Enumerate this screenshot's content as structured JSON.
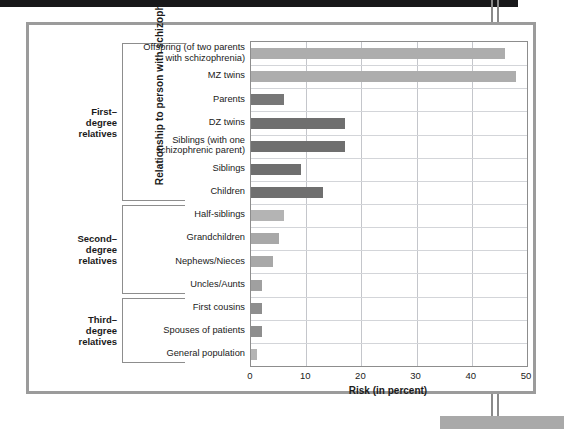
{
  "chart_data": {
    "type": "bar",
    "orientation": "horizontal",
    "title": "",
    "xlabel": "Risk (in percent)",
    "ylabel": "Relationship to person with schizophrenia",
    "xlim": [
      0,
      50
    ],
    "xticks": [
      0,
      10,
      20,
      30,
      40,
      50
    ],
    "grid": true,
    "legend": "none",
    "categories": [
      "Offspring (of two parents\nwith schizophrenia)",
      "MZ twins",
      "Parents",
      "DZ twins",
      "Siblings (with one\nschizophrenic parent)",
      "Siblings",
      "Children",
      "Half-siblings",
      "Grandchildren",
      "Nephews/Nieces",
      "Uncles/Aunts",
      "First cousins",
      "Spouses  of patients",
      "General population"
    ],
    "values": [
      46,
      48,
      6,
      17,
      17,
      9,
      13,
      6,
      5,
      4,
      2,
      2,
      2,
      1
    ],
    "bars": [
      {
        "label_line1": "Offspring (of two parents",
        "label_line2": "with schizophrenia)",
        "value": 46,
        "color": "#adadad"
      },
      {
        "label_line1": "MZ twins",
        "label_line2": "",
        "value": 48,
        "color": "#adadad"
      },
      {
        "label_line1": "Parents",
        "label_line2": "",
        "value": 6,
        "color": "#777777"
      },
      {
        "label_line1": "DZ twins",
        "label_line2": "",
        "value": 17,
        "color": "#6f6f6f"
      },
      {
        "label_line1": "Siblings (with one",
        "label_line2": "schizophrenic parent)",
        "value": 17,
        "color": "#6f6f6f"
      },
      {
        "label_line1": "Siblings",
        "label_line2": "",
        "value": 9,
        "color": "#6f6f6f"
      },
      {
        "label_line1": "Children",
        "label_line2": "",
        "value": 13,
        "color": "#6f6f6f"
      },
      {
        "label_line1": "Half-siblings",
        "label_line2": "",
        "value": 6,
        "color": "#b4b4b4"
      },
      {
        "label_line1": "Grandchildren",
        "label_line2": "",
        "value": 5,
        "color": "#a8a8a8"
      },
      {
        "label_line1": "Nephews/Nieces",
        "label_line2": "",
        "value": 4,
        "color": "#a8a8a8"
      },
      {
        "label_line1": "Uncles/Aunts",
        "label_line2": "",
        "value": 2,
        "color": "#a0a0a0"
      },
      {
        "label_line1": "First cousins",
        "label_line2": "",
        "value": 2,
        "color": "#8e8e8e"
      },
      {
        "label_line1": "Spouses  of patients",
        "label_line2": "",
        "value": 2,
        "color": "#8e8e8e"
      },
      {
        "label_line1": "General population",
        "label_line2": "",
        "value": 1,
        "color": "#b4b4b4"
      }
    ],
    "groups": [
      {
        "name": "first-degree",
        "label_lines": [
          "First–",
          "degree",
          "relatives"
        ],
        "from_index": 0,
        "to_index": 6
      },
      {
        "name": "second-degree",
        "label_lines": [
          "Second–",
          "degree",
          "relatives"
        ],
        "from_index": 7,
        "to_index": 10
      },
      {
        "name": "third-degree",
        "label_lines": [
          "Third–",
          "degree",
          "relatives"
        ],
        "from_index": 11,
        "to_index": 13
      }
    ]
  },
  "axis": {
    "x_title": "Risk (in percent)",
    "y_title": "Relationship to person with schizophrenia",
    "x_tick_labels": [
      "0",
      "10",
      "20",
      "30",
      "40",
      "50"
    ]
  },
  "colors": {
    "frame": "#9b9b9b",
    "gridline": "#c4c6cb",
    "bracket": "#8d8d8d",
    "text": "#1a1a1a",
    "page_top_bar": "#18181a",
    "page_band": "#a9a9a9"
  }
}
